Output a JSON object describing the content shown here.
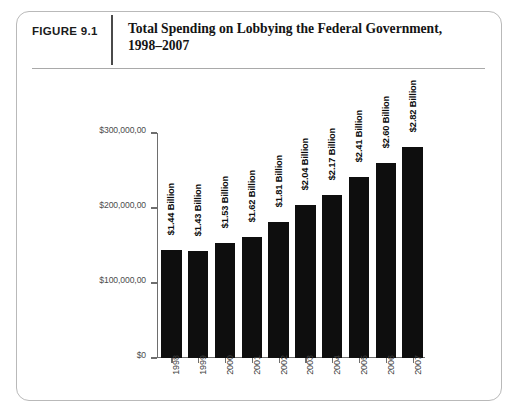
{
  "figure": {
    "tag": "FIGURE 9.1",
    "title_line1": "Total Spending on Lobbying the Federal Government,",
    "title_line2": "1998–2007"
  },
  "chart_data": {
    "type": "bar",
    "title": "Total Spending on Lobbying the Federal Government, 1998–2007",
    "xlabel": "",
    "ylabel": "",
    "categories": [
      "1998",
      "1999",
      "2000",
      "2001",
      "2002",
      "2003",
      "2004",
      "2005",
      "2006",
      "2007"
    ],
    "values": [
      1.44,
      1.43,
      1.53,
      1.62,
      1.81,
      2.04,
      2.17,
      2.41,
      2.6,
      2.82
    ],
    "value_labels": [
      "$1.44 Billion",
      "$1.43 Billion",
      "$1.53 Billion",
      "$1.62 Billion",
      "$1.81 Billion",
      "$2.04 Billion",
      "$2.17 Billion",
      "$2.41 Billion",
      "$2.60 Billion",
      "$2.82 Billion"
    ],
    "ytick_labels": [
      "$300,000,00",
      "$200,000,00",
      "$100,000,00",
      "$0"
    ],
    "ytick_values": [
      3.0,
      2.0,
      1.0,
      0.0
    ],
    "ylim": [
      0,
      3.0
    ],
    "grid": false,
    "legend": false,
    "bar_color": "#0e0e0e",
    "axis_color": "#6e6e6e"
  }
}
